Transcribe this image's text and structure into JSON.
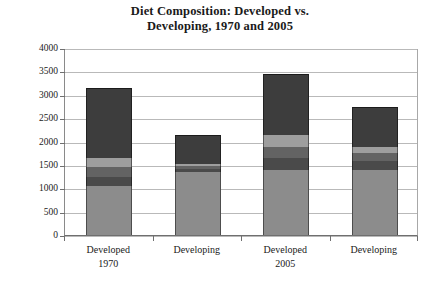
{
  "chart_data": {
    "type": "bar",
    "subtype": "stacked-bar",
    "title": "Diet Composition: Developed vs. Developing, 1970 and 2005",
    "title_lines": [
      "Diet Composition: Developed vs.",
      "Developing, 1970 and 2005"
    ],
    "xlabel": "",
    "ylabel": "",
    "ylim": [
      0,
      4000
    ],
    "ytick_step": 500,
    "yticks": [
      "4000",
      "3500",
      "3000",
      "2500",
      "2000",
      "1500",
      "1000",
      "500",
      "0"
    ],
    "ytick_values": [
      4000,
      3500,
      3000,
      2500,
      2000,
      1500,
      1000,
      500,
      0
    ],
    "grid": true,
    "legend": "none",
    "categories": [
      "Developed",
      "Developing",
      "Developed",
      "Developing"
    ],
    "category_sublabels": [
      "1970",
      "",
      "2005",
      ""
    ],
    "category_groups": [
      "1970",
      "1970",
      "2005",
      "2005"
    ],
    "series": [
      {
        "name": "segment-1",
        "color": "#8c8c8c",
        "values": [
          1050,
          1350,
          1400,
          1400
        ]
      },
      {
        "name": "segment-2",
        "color": "#4a4a4a",
        "values": [
          200,
          60,
          250,
          180
        ]
      },
      {
        "name": "segment-3",
        "color": "#636363",
        "values": [
          200,
          60,
          230,
          180
        ]
      },
      {
        "name": "segment-4",
        "color": "#9e9e9e",
        "values": [
          200,
          60,
          250,
          130
        ]
      },
      {
        "name": "segment-5",
        "color": "#3d3d3d",
        "values": [
          1500,
          600,
          1320,
          850
        ]
      }
    ],
    "totals": [
      3150,
      2130,
      3450,
      2740
    ],
    "bar_color_note": "grayscale stacked segments, no legend shown"
  },
  "colors": {
    "background": "#ffffff",
    "gridline": "#b9b9b9",
    "axis": "#6f6f6f",
    "text": "#1a1a1a"
  }
}
